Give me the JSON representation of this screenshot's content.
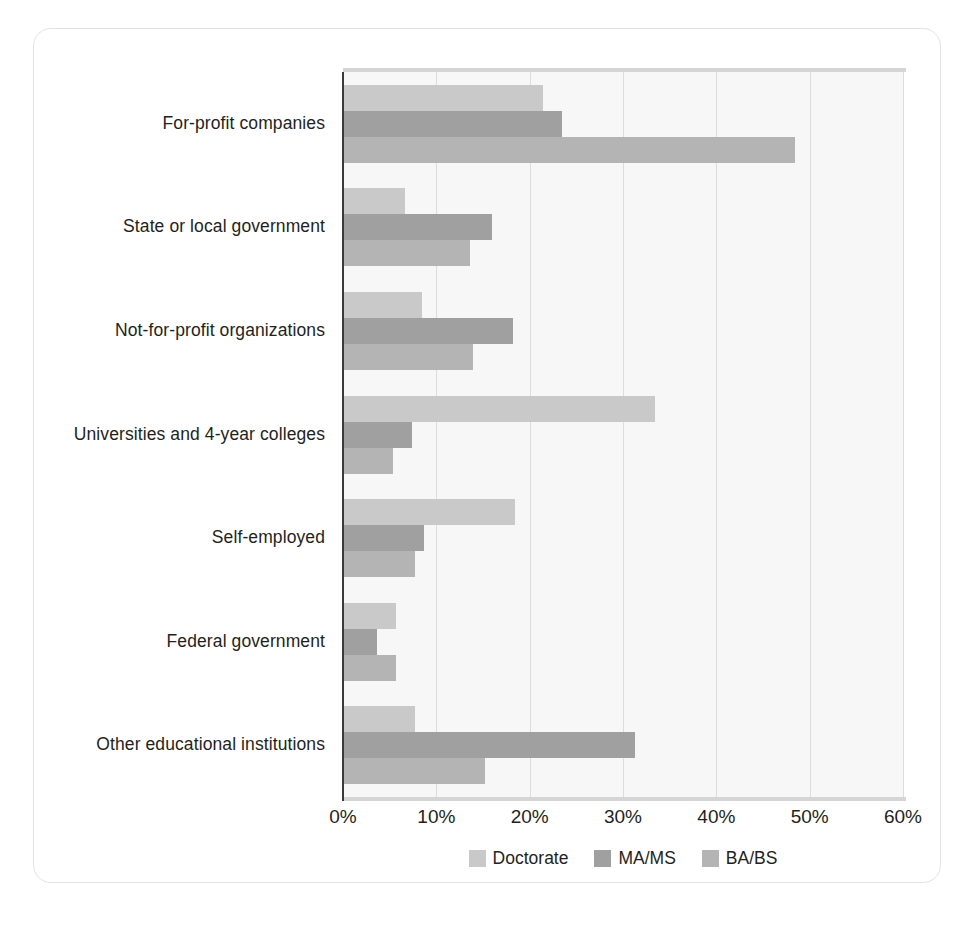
{
  "chart_data": {
    "type": "bar",
    "orientation": "horizontal",
    "title": "",
    "subtitle": "",
    "xlabel": "",
    "ylabel": "",
    "xlim": [
      0,
      60
    ],
    "x_tick_labels": [
      "0%",
      "10%",
      "20%",
      "30%",
      "40%",
      "50%",
      "60%"
    ],
    "x_tick_values": [
      0,
      10,
      20,
      30,
      40,
      50,
      60
    ],
    "grid": "vertical",
    "legend_position": "bottom-center",
    "categories": [
      "For-profit companies",
      "State or local government",
      "Not-for-profit organizations",
      "Universities and 4-year colleges",
      "Self-employed",
      "Federal government",
      "Other educational institutions"
    ],
    "series": [
      {
        "name": "Doctorate",
        "color": "#c9c9c9",
        "values": [
          21.4,
          6.6,
          8.5,
          33.4,
          18.4,
          5.7,
          7.7
        ]
      },
      {
        "name": "MA/MS",
        "color": "#a0a0a0",
        "values": [
          23.5,
          16.0,
          18.2,
          7.4,
          8.7,
          3.6,
          31.3
        ]
      },
      {
        "name": "BA/BS",
        "color": "#b4b4b4",
        "values": [
          48.4,
          13.6,
          13.9,
          5.4,
          7.7,
          5.7,
          15.2
        ]
      }
    ]
  },
  "legend": {
    "items": [
      {
        "label": "Doctorate",
        "color": "#c9c9c9"
      },
      {
        "label": "MA/MS",
        "color": "#a0a0a0"
      },
      {
        "label": "BA/BS",
        "color": "#b4b4b4"
      }
    ]
  },
  "axis_labels": {
    "tick_0": "0%",
    "tick_1": "10%",
    "tick_2": "20%",
    "tick_3": "30%",
    "tick_4": "40%",
    "tick_5": "50%",
    "tick_6": "60%"
  },
  "colors": {
    "frame_border": "#e2e2e2",
    "plot_background": "#f7f7f7",
    "gridline": "#dcdcdc",
    "axis_spine": "#3a3a3a",
    "rule": "#d5d5d5",
    "text": "#231f20"
  }
}
